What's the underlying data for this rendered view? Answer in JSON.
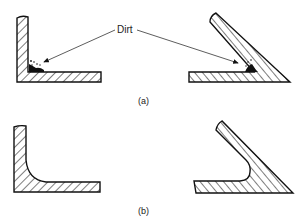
{
  "figure": {
    "callout_label": "Dirt",
    "panels": [
      {
        "id": "a",
        "caption": "(a)",
        "description": "Sharp inside corners trap dirt"
      },
      {
        "id": "b",
        "caption": "(b)",
        "description": "Radiused inside corners avoid dirt traps"
      }
    ]
  },
  "colors": {
    "ink": "#111111",
    "background": "#ffffff",
    "label": "#222222"
  }
}
